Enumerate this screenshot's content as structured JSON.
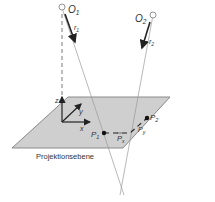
{
  "diagram": {
    "plane_label": "Projektionsebene",
    "points": {
      "o1": "O",
      "o1_sub": "1",
      "o2": "O",
      "o2_sub": "2",
      "p1": "P",
      "p1_sub": "1",
      "p2": "P",
      "p2_sub": "2"
    },
    "vectors": {
      "r1": "r",
      "r1_sub": "1",
      "r2": "r",
      "r2_sub": "2",
      "px": "P",
      "px_sub": "x",
      "py": "P",
      "py_sub": "y"
    },
    "axes": {
      "x": "x",
      "y": "y",
      "z": "z"
    },
    "colors": {
      "plane_fill": "#cfcfcf",
      "plane_stroke": "#8a8a8a",
      "line": "#555555",
      "ray": "#9a9a9a"
    }
  }
}
